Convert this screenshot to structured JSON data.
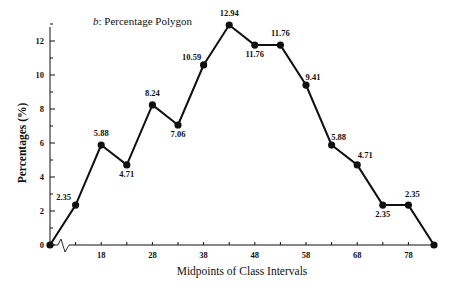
{
  "chart_data": {
    "type": "line",
    "title": "b: Percentage Polygon",
    "title_prefix": "b",
    "title_text": ": Percentage Polygon",
    "xlabel": "Midpoints of Class Intervals",
    "ylabel": "Percentages (%)",
    "x": [
      8,
      13,
      18,
      23,
      28,
      33,
      38,
      43,
      48,
      53,
      58,
      63,
      68,
      73,
      78,
      83
    ],
    "values": [
      0,
      2.35,
      5.88,
      4.71,
      8.24,
      7.06,
      10.59,
      12.94,
      11.76,
      11.76,
      9.41,
      5.88,
      4.71,
      2.35,
      2.35,
      0
    ],
    "point_labels": [
      "",
      "2.35",
      "5.88",
      "4.71",
      "8.24",
      "7.06",
      "10.59",
      "12.94",
      "11.76",
      "11.76",
      "9.41",
      "5.88",
      "4.71",
      "2.35",
      "2.35",
      ""
    ],
    "x_ticks": [
      18,
      28,
      38,
      48,
      58,
      68,
      78
    ],
    "x_tick_labels": [
      "18",
      "28",
      "38",
      "48",
      "58",
      "68",
      "78"
    ],
    "y_ticks": [
      0,
      2,
      4,
      6,
      8,
      10,
      12
    ],
    "y_tick_labels": [
      "0",
      "2",
      "4",
      "6",
      "8",
      "10",
      "12"
    ],
    "ylim": [
      0,
      13
    ],
    "xlim": [
      8,
      83
    ],
    "grid": false,
    "legend": null,
    "axis_break": true,
    "colors": {
      "line": "#111111",
      "marker": "#111111",
      "background": "#ffffff"
    }
  }
}
